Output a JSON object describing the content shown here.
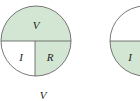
{
  "diagram": {
    "colors": {
      "fill": "#d3e6d3",
      "stroke": "#555555",
      "background": "#ffffff"
    },
    "circle1": {
      "top_label": "V",
      "bottom_left_label": "I",
      "bottom_right_label": "R",
      "highlighted": [
        "top",
        "bottom-right"
      ]
    },
    "circle2": {
      "bottom_left_label": "I",
      "highlighted": [
        "bottom"
      ]
    },
    "caption": "V"
  }
}
